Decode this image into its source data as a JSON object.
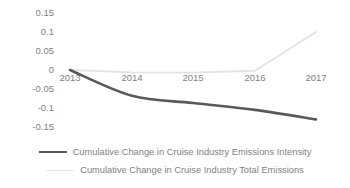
{
  "chart_data": {
    "type": "line",
    "title": "",
    "xlabel": "",
    "ylabel": "",
    "x": [
      "2013",
      "2014",
      "2015",
      "2016",
      "2017"
    ],
    "categories": [
      "2013",
      "2014",
      "2015",
      "2016",
      "2017"
    ],
    "ylim": [
      -0.15,
      0.15
    ],
    "yticks": [
      "0.15",
      "0.1",
      "0.05",
      "0",
      "-0.05",
      "-0.1",
      "-0.15"
    ],
    "ytick_values": [
      0.15,
      0.1,
      0.05,
      0,
      -0.05,
      -0.1,
      -0.15
    ],
    "grid": false,
    "legend_position": "bottom",
    "series": [
      {
        "name": "Cumulative Change in Cruise Industry Emissions Intensity",
        "color": "#595959",
        "values": [
          0,
          -0.068,
          -0.087,
          -0.105,
          -0.13
        ]
      },
      {
        "name": "Cumulative Change in Cruise Industry Total Emissions",
        "color": "#e3e3e3",
        "values": [
          0,
          -0.006,
          -0.007,
          -0.002,
          0.1
        ]
      }
    ]
  },
  "axes": {
    "y_ticks": [
      {
        "label": "0.15",
        "y": 13
      },
      {
        "label": "0.1",
        "y": 32
      },
      {
        "label": "0.05",
        "y": 51
      },
      {
        "label": "0",
        "y": 70
      },
      {
        "label": "-0.05",
        "y": 89
      },
      {
        "label": "-0.1",
        "y": 108
      },
      {
        "label": "-0.15",
        "y": 127
      }
    ],
    "x_ticks": [
      {
        "label": "2013",
        "x": 70
      },
      {
        "label": "2014",
        "x": 132
      },
      {
        "label": "2015",
        "x": 193
      },
      {
        "label": "2016",
        "x": 255
      },
      {
        "label": "2017",
        "x": 316
      }
    ]
  },
  "legend": {
    "entries": [
      {
        "label": "Cumulative Change in Cruise Industry Emissions Intensity",
        "color": "#595959",
        "style": "thick"
      },
      {
        "label": "Cumulative Change in Cruise Industry Total Emissions",
        "color": "#e3e3e3",
        "style": "thin"
      }
    ]
  }
}
